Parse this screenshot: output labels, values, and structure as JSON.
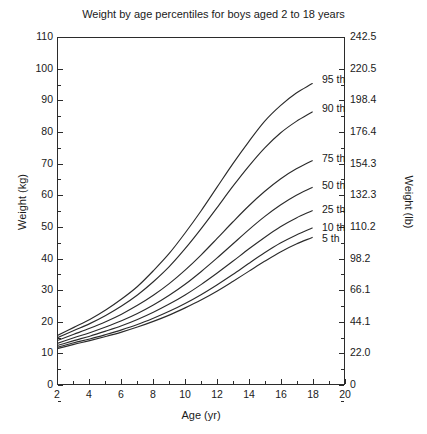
{
  "chart_data": {
    "type": "line",
    "title": "Weight by age percentiles for boys aged 2 to 18 years",
    "xlabel": "Age (yr)",
    "ylabel": "Weight (kg)",
    "ylabel_right": "Weight (lb)",
    "xlim": [
      2,
      20
    ],
    "ylim": [
      0,
      110
    ],
    "grid": false,
    "legend_position": "inline-right-of-curve-ends",
    "xticks": [
      2,
      4,
      6,
      8,
      10,
      12,
      14,
      16,
      18,
      20
    ],
    "xtick_labels": [
      "2",
      "4",
      "6",
      "8",
      "10",
      "12",
      "14",
      "16",
      "18",
      "20"
    ],
    "yticks": [
      0,
      10,
      20,
      30,
      40,
      50,
      60,
      70,
      80,
      90,
      100,
      110
    ],
    "ytick_labels": [
      "0",
      "10",
      "20",
      "30",
      "40",
      "50",
      "60",
      "70",
      "80",
      "90",
      "100",
      "110"
    ],
    "yticks_right_kg": [
      0,
      10,
      20,
      30,
      40,
      50,
      60,
      70,
      80,
      90,
      100,
      110
    ],
    "ytick_labels_right": [
      "0",
      "22.0",
      "44.1",
      "66.1",
      "98.2",
      "110.2",
      "132.3",
      "154.3",
      "176.4",
      "198.4",
      "220.5",
      "242.5"
    ],
    "x": [
      2,
      3,
      4,
      5,
      6,
      7,
      8,
      9,
      10,
      11,
      12,
      13,
      14,
      15,
      16,
      17,
      18
    ],
    "series": [
      {
        "name": "95 th",
        "label": "95 th",
        "values": [
          15.5,
          18.0,
          20.5,
          23.5,
          27.0,
          31.0,
          36.0,
          41.5,
          48.0,
          55.0,
          62.5,
          70.0,
          77.0,
          83.5,
          88.5,
          92.5,
          95.5
        ]
      },
      {
        "name": "90 th",
        "label": "90 th",
        "values": [
          14.8,
          17.0,
          19.2,
          21.8,
          24.8,
          28.3,
          32.5,
          37.3,
          43.0,
          49.3,
          56.0,
          62.8,
          69.2,
          75.0,
          79.8,
          83.5,
          86.5
        ]
      },
      {
        "name": "75 th",
        "label": "75 th",
        "values": [
          13.9,
          15.8,
          17.7,
          19.8,
          22.2,
          25.0,
          28.2,
          31.9,
          36.2,
          41.0,
          46.2,
          51.5,
          56.6,
          61.2,
          65.2,
          68.4,
          71.0
        ]
      },
      {
        "name": "50 th",
        "label": "50 th",
        "values": [
          13.0,
          14.7,
          16.3,
          18.1,
          20.1,
          22.4,
          25.1,
          28.2,
          31.7,
          35.7,
          40.0,
          44.5,
          49.0,
          53.2,
          56.9,
          60.0,
          62.5
        ]
      },
      {
        "name": "25 th",
        "label": "25 th",
        "values": [
          12.3,
          13.8,
          15.2,
          16.8,
          18.5,
          20.5,
          22.8,
          25.4,
          28.3,
          31.6,
          35.2,
          39.0,
          42.9,
          46.6,
          50.0,
          52.8,
          55.1
        ]
      },
      {
        "name": "10 th",
        "label": "10 th",
        "values": [
          11.7,
          13.1,
          14.3,
          15.7,
          17.2,
          18.9,
          20.9,
          23.1,
          25.6,
          28.4,
          31.5,
          34.8,
          38.3,
          41.7,
          44.8,
          47.4,
          49.6
        ]
      },
      {
        "name": "5 th",
        "label": "5 th",
        "values": [
          11.3,
          12.6,
          13.8,
          15.1,
          16.5,
          18.1,
          19.9,
          21.9,
          24.2,
          26.7,
          29.5,
          32.6,
          35.8,
          39.0,
          42.0,
          44.5,
          46.6
        ]
      }
    ]
  }
}
